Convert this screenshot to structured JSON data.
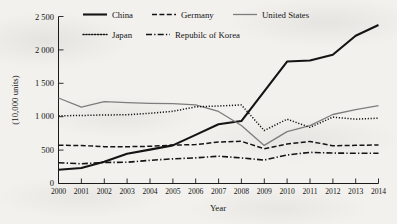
{
  "chart_data": {
    "type": "line",
    "title": "",
    "xlabel": "Year",
    "ylabel": "(10,000 units)",
    "x": [
      2000,
      2001,
      2002,
      2003,
      2004,
      2005,
      2006,
      2007,
      2008,
      2009,
      2010,
      2011,
      2012,
      2013,
      2014
    ],
    "categories": [
      "2000",
      "2001",
      "2002",
      "2003",
      "2004",
      "2005",
      "2006",
      "2007",
      "2008",
      "2009",
      "2010",
      "2011",
      "2012",
      "2013",
      "2014"
    ],
    "xlim": [
      2000,
      2014
    ],
    "ylim": [
      0,
      2500
    ],
    "yticks": [
      0,
      500,
      1000,
      1500,
      2000,
      2500
    ],
    "ytick_labels": [
      "0",
      "500",
      "1 000",
      "1 500",
      "2 000",
      "2 500"
    ],
    "grid": false,
    "legend_position": "top-inside",
    "series": [
      {
        "name": "China",
        "style": "solid",
        "color": "#141414",
        "width": 2.1,
        "values": [
          205,
          233,
          325,
          444,
          507,
          571,
          728,
          888,
          935,
          1379,
          1826,
          1842,
          1928,
          2212,
          2372
        ]
      },
      {
        "name": "Germany",
        "style": "dashed",
        "color": "#141414",
        "width": 1.5,
        "values": [
          573,
          568,
          552,
          551,
          557,
          575,
          582,
          621,
          632,
          521,
          591,
          630,
          565,
          571,
          578
        ]
      },
      {
        "name": "United States",
        "style": "solid-thin",
        "color": "#7d7d7d",
        "width": 1.3,
        "values": [
          1280,
          1142,
          1225,
          1210,
          1199,
          1195,
          1178,
          1078,
          868,
          570,
          776,
          866,
          1033,
          1107,
          1166
        ]
      },
      {
        "name": "Japan",
        "style": "dotted",
        "color": "#141414",
        "width": 1.5,
        "values": [
          1014,
          1018,
          1026,
          1029,
          1051,
          1080,
          1148,
          1160,
          1176,
          793,
          963,
          840,
          994,
          963,
          978
        ]
      },
      {
        "name": "Repubilc of Korea",
        "style": "dash-dot",
        "color": "#141414",
        "width": 1.6,
        "values": [
          311,
          295,
          315,
          318,
          347,
          369,
          384,
          409,
          383,
          351,
          427,
          466,
          456,
          452,
          452
        ]
      }
    ]
  },
  "axes": {
    "y_axis_title": "(10,000 units)",
    "x_axis_title": "Year",
    "y_tick_labels": [
      "0",
      "500",
      "1 000",
      "1 500",
      "2 000",
      "2 500"
    ],
    "x_tick_labels": [
      "2000",
      "2001",
      "2002",
      "2003",
      "2004",
      "2005",
      "2006",
      "2007",
      "2008",
      "2009",
      "2010",
      "2011",
      "2012",
      "2013",
      "2014"
    ]
  },
  "legend": {
    "row1": [
      {
        "label": "China",
        "style": "solid"
      },
      {
        "label": "Germany",
        "style": "dashed"
      },
      {
        "label": "United States",
        "style": "solid-thin"
      }
    ],
    "row2": [
      {
        "label": "Japan",
        "style": "dotted"
      },
      {
        "label": "Repubilc of Korea",
        "style": "dash-dot"
      }
    ]
  }
}
